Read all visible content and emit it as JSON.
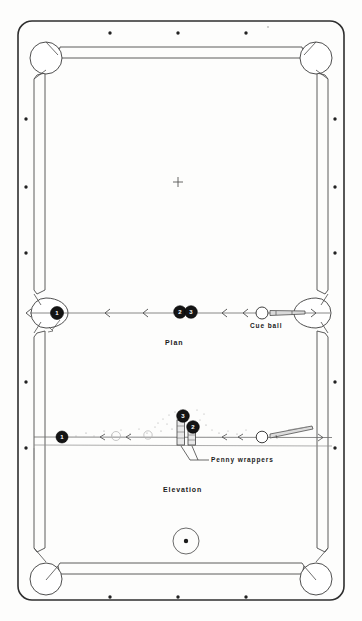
{
  "figure": {
    "background_color": "#fdfdfc",
    "ink_color": "#2a2a2a"
  },
  "views": {
    "plan": {
      "label": "Plan",
      "label_x": 165,
      "label_y": 339
    },
    "elevation": {
      "label": "Elevation",
      "label_x": 163,
      "label_y": 486
    }
  },
  "annotations": [
    {
      "name": "cue-ball-label",
      "text": "Cue ball",
      "x": 250,
      "y": 322
    },
    {
      "name": "penny-wrappers-label",
      "text": "Penny wrappers",
      "x": 211,
      "y": 456
    }
  ],
  "plan_view": {
    "shot_line_y": 313,
    "balls": [
      {
        "name": "object-ball-1",
        "number": "1",
        "cx": 57,
        "cy": 313,
        "r": 6.5,
        "fill": "#141414"
      },
      {
        "name": "object-ball-2",
        "number": "2",
        "cx": 180,
        "cy": 312,
        "r": 6.3,
        "fill": "#141414"
      },
      {
        "name": "object-ball-3",
        "number": "3",
        "cx": 191,
        "cy": 312,
        "r": 6.3,
        "fill": "#141414"
      },
      {
        "name": "cue-ball",
        "number": "",
        "cx": 262,
        "cy": 313,
        "r": 6.0,
        "fill": "#ffffff"
      }
    ],
    "direction_arrows_x": [
      26,
      105,
      143,
      222,
      243,
      316
    ],
    "cue_stick": {
      "x1": 271,
      "y1": 313,
      "x2": 306,
      "y2": 312
    }
  },
  "elevation_view": {
    "table_bed_y": 437,
    "balls": [
      {
        "name": "elevation-ball-1",
        "number": "1",
        "cx": 62,
        "cy": 437,
        "r": 6.0,
        "fill": "#141414"
      },
      {
        "name": "elevation-ball-3-upper",
        "number": "3",
        "cx": 183,
        "cy": 416,
        "r": 6.3,
        "fill": "#141414"
      },
      {
        "name": "elevation-ball-2-lower",
        "number": "2",
        "cx": 193,
        "cy": 427,
        "r": 6.3,
        "fill": "#141414"
      },
      {
        "name": "elevation-cue-ball",
        "number": "",
        "cx": 262,
        "cy": 437,
        "r": 5.8,
        "fill": "#ffffff"
      }
    ],
    "penny_wrapper_columns": [
      {
        "name": "penny-wrapper-left",
        "x": 180,
        "y_top": 420,
        "y_bottom": 444,
        "width": 7
      },
      {
        "name": "penny-wrapper-right",
        "x": 190,
        "y_top": 428,
        "y_bottom": 444,
        "width": 7
      }
    ],
    "leader_lines": [
      {
        "from_x": 182,
        "from_y": 446,
        "to_x": 196,
        "to_y": 459
      },
      {
        "from_x": 192,
        "from_y": 446,
        "to_x": 200,
        "to_y": 459
      }
    ]
  },
  "table": {
    "outer_rail": {
      "x": 18,
      "y": 21,
      "width": 326,
      "height": 579,
      "radius": 14
    },
    "cushion_inset": 22,
    "pockets": [
      {
        "name": "pocket-top-left",
        "cx": 46,
        "cy": 58,
        "r": 16
      },
      {
        "name": "pocket-top-right",
        "cx": 316,
        "cy": 58,
        "r": 16
      },
      {
        "name": "pocket-side-left",
        "cx": 46,
        "cy": 313,
        "r": 15
      },
      {
        "name": "pocket-side-right",
        "cx": 316,
        "cy": 313,
        "r": 15
      },
      {
        "name": "pocket-bottom-left",
        "cx": 46,
        "cy": 579,
        "r": 16
      },
      {
        "name": "pocket-bottom-right",
        "cx": 316,
        "cy": 579,
        "r": 16
      }
    ],
    "diamonds_top": [
      {
        "x": 110,
        "y": 33
      },
      {
        "x": 178,
        "y": 33
      },
      {
        "x": 246,
        "y": 33
      }
    ],
    "diamonds_bottom": [
      {
        "x": 110,
        "y": 597
      },
      {
        "x": 178,
        "y": 597
      },
      {
        "x": 246,
        "y": 597
      }
    ],
    "diamonds_left": [
      {
        "x": 26,
        "y": 119
      },
      {
        "x": 26,
        "y": 187
      },
      {
        "x": 26,
        "y": 253
      },
      {
        "x": 26,
        "y": 382
      },
      {
        "x": 26,
        "y": 448
      }
    ],
    "diamonds_right": [
      {
        "x": 335,
        "y": 119
      },
      {
        "x": 335,
        "y": 187
      },
      {
        "x": 335,
        "y": 253
      },
      {
        "x": 335,
        "y": 382
      },
      {
        "x": 335,
        "y": 448
      }
    ],
    "center_mark": {
      "name": "table-center-cross",
      "x": 178,
      "y": 182,
      "size": 5
    },
    "spot_ball": {
      "name": "spotted-ball",
      "cx": 186,
      "cy": 541,
      "r": 13
    }
  }
}
